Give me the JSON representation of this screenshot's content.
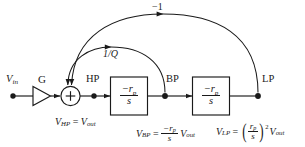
{
  "diagram": {
    "background_color": "#ffffff",
    "line_color": "#1a1a1a"
  },
  "signals": {
    "input_label": "V",
    "input_sub": "in",
    "gain_label": "G",
    "sum_symbol": "+",
    "hp_label": "HP",
    "bp_label": "BP",
    "lp_label": "LP"
  },
  "blocks": [
    {
      "name": "first-integrator",
      "numerator": "−r",
      "numerator_sub": "p",
      "denominator": "s"
    },
    {
      "name": "second-integrator",
      "numerator": "−r",
      "numerator_sub": "p",
      "denominator": "s"
    }
  ],
  "feedback": {
    "outer_label": "−1",
    "inner_label": "1/Q"
  },
  "equations": {
    "hp": {
      "lhs": "V",
      "lhs_sub": "HP",
      "eq": "=",
      "rhs": "V",
      "rhs_sub": "out"
    },
    "bp": {
      "lhs": "V",
      "lhs_sub": "BP",
      "eq": "=",
      "num": "−r",
      "num_sub": "p",
      "den": "s",
      "tail": "V",
      "tail_sub": "out"
    },
    "lp": {
      "lhs": "V",
      "lhs_sub": "LP",
      "eq": "=",
      "paren_open": "(",
      "num": "r",
      "num_sub": "p",
      "den": "s",
      "paren_close": ")",
      "exponent": "2",
      "tail": "V",
      "tail_sub": "out"
    }
  }
}
